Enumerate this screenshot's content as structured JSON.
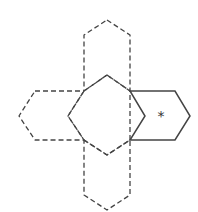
{
  "diagram": {
    "marked_face_label": "*",
    "colors": {
      "line": "#444444",
      "background": "#ffffff"
    },
    "faces": [
      {
        "name": "top-face",
        "style": "dashed",
        "points": "107,20 130,35 130,91 107,75 84,91 84,35"
      },
      {
        "name": "left-face",
        "style": "dashed",
        "points": "35,91 84,91 68,116 84,140 35,140 19,116"
      },
      {
        "name": "center-face",
        "style": "dashed",
        "points": "107,75 130,91 130,140 107,155 84,140 68,116 84,91"
      },
      {
        "name": "bottom-face",
        "style": "dashed",
        "points": "84,140 107,155 130,140 130,195 107,210 84,195"
      },
      {
        "name": "right-face-marked",
        "style": "solid",
        "points": "130,91 175,91 190,116 175,140 130,140 145,116"
      }
    ]
  }
}
